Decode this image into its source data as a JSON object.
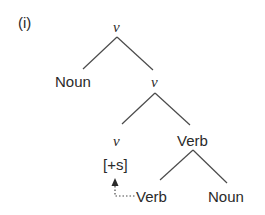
{
  "example_label": "(i)",
  "tree": {
    "root": {
      "label": "v"
    },
    "level1": {
      "left": "Noun",
      "right": "v"
    },
    "level2": {
      "left": "v",
      "right": "Verb"
    },
    "level3": {
      "feature": "[+s]",
      "left": "Verb",
      "right": "Noun"
    },
    "movement": {
      "from": "Verb",
      "to": "[+s]",
      "style": "dotted-arrow"
    }
  },
  "colors": {
    "line": "#4a4a4a",
    "text": "#2a2a2a"
  }
}
